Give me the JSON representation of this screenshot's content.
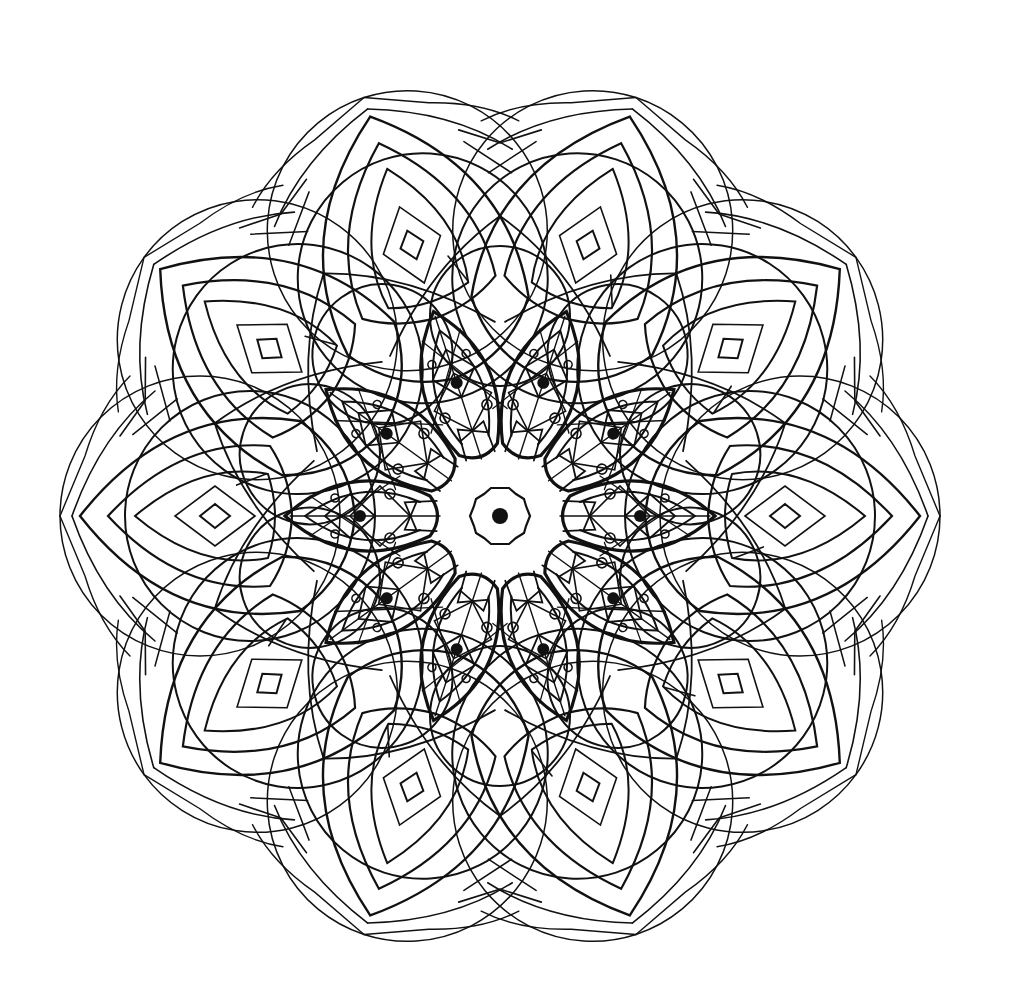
{
  "artwork": {
    "title": "Mandala line art",
    "type": "radial-symmetric-line-drawing",
    "symmetry_fold": 10,
    "center": [
      500,
      516
    ],
    "colors": {
      "background": "#ffffff",
      "ink": "#111111"
    },
    "outer_radius": 440,
    "center_dot_radius": 8,
    "center_star_points": 10
  }
}
